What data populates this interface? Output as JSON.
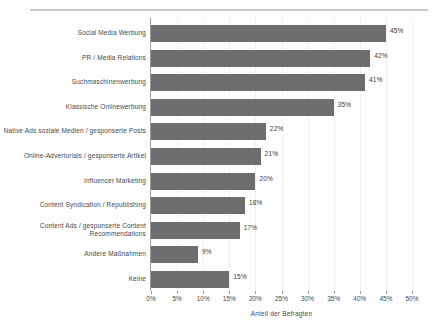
{
  "chart_data": {
    "type": "bar",
    "orientation": "horizontal",
    "title": "",
    "xlabel": "Anteil der Befragten",
    "ylabel": "",
    "xlim": [
      0,
      50
    ],
    "grid": true,
    "legend": "none",
    "value_suffix": "%",
    "xticks": [
      "0%",
      "5%",
      "10%",
      "15%",
      "20%",
      "25%",
      "30%",
      "35%",
      "40%",
      "45%",
      "50%"
    ],
    "xtick_values": [
      0,
      5,
      10,
      15,
      20,
      25,
      30,
      35,
      40,
      45,
      50
    ],
    "bar_color": "#6e6e6e",
    "categories": [
      "Social Media Werbung",
      "PR / Media Relations",
      "Suchmaschinenwerbung",
      "Klassische Onlinewerbung",
      "Native Ads soziale Medien / gesponserte Posts",
      "Online-Advertorials / gesponserte Artikel",
      "Influencer Marketing",
      "Content Syndication / Republishing",
      "Content Ads / gesponserte Content Recommendations",
      "Andere Maßnahmen",
      "Keine"
    ],
    "values": [
      45,
      42,
      41,
      35,
      22,
      21,
      20,
      18,
      17,
      9,
      15
    ],
    "data_labels": [
      "45%",
      "42%",
      "41%",
      "35%",
      "22%",
      "21%",
      "20%",
      "18%",
      "17%",
      "9%",
      "15%"
    ]
  }
}
